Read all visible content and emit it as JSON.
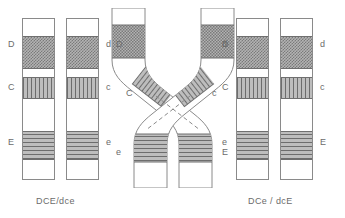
{
  "figure": {
    "type": "genetics-crossover-diagram",
    "band_patterns": {
      "D": "checker",
      "C": "vertical-hatch",
      "E": "horizontal-hatch"
    },
    "colors": {
      "outline": "#8a8a8a",
      "band_dark": "#6d6d6d",
      "band_light": "#bdbdbd",
      "text": "#6b6b6b",
      "background": "#ffffff"
    }
  },
  "panels": {
    "left": {
      "name": "parental-pair",
      "haplotype_label": "DCE/dce",
      "chromosome1": {
        "name": "chromosome-DCE",
        "loci": [
          {
            "symbol": "D",
            "allele": "D",
            "pattern": "checker"
          },
          {
            "symbol": "C",
            "allele": "C",
            "pattern": "vertical-hatch"
          },
          {
            "symbol": "E",
            "allele": "E",
            "pattern": "horizontal-hatch"
          }
        ]
      },
      "chromosome2": {
        "name": "chromosome-dce",
        "loci": [
          {
            "symbol": "d",
            "allele": "d",
            "pattern": "checker"
          },
          {
            "symbol": "c",
            "allele": "c",
            "pattern": "vertical-hatch"
          },
          {
            "symbol": "e",
            "allele": "e",
            "pattern": "horizontal-hatch"
          }
        ]
      }
    },
    "center": {
      "name": "crossover-pair",
      "haplotype_label": "",
      "chromosome1": {
        "name": "chromosome-crossing-left",
        "loci": [
          {
            "symbol": "D",
            "allele": "D",
            "pattern": "checker"
          },
          {
            "symbol": "C",
            "allele": "C",
            "pattern": "vertical-hatch"
          },
          {
            "symbol": "e",
            "allele": "e",
            "pattern": "horizontal-hatch"
          }
        ]
      },
      "chromosome2": {
        "name": "chromosome-crossing-right",
        "loci": [
          {
            "symbol": "d",
            "allele": "d",
            "pattern": "checker"
          },
          {
            "symbol": "c",
            "allele": "c",
            "pattern": "vertical-hatch"
          },
          {
            "symbol": "E",
            "allele": "E",
            "pattern": "horizontal-hatch"
          }
        ]
      }
    },
    "right": {
      "name": "recombinant-pair",
      "haplotype_label": "DCe / dcE",
      "chromosome1": {
        "name": "chromosome-DCe",
        "loci": [
          {
            "symbol": "D",
            "allele": "D",
            "pattern": "checker"
          },
          {
            "symbol": "C",
            "allele": "C",
            "pattern": "vertical-hatch"
          },
          {
            "symbol": "e",
            "allele": "e",
            "pattern": "horizontal-hatch"
          }
        ]
      },
      "chromosome2": {
        "name": "chromosome-dcE",
        "loci": [
          {
            "symbol": "d",
            "allele": "d",
            "pattern": "checker"
          },
          {
            "symbol": "c",
            "allele": "c",
            "pattern": "vertical-hatch"
          },
          {
            "symbol": "E",
            "allele": "E",
            "pattern": "horizontal-hatch"
          }
        ]
      }
    }
  }
}
